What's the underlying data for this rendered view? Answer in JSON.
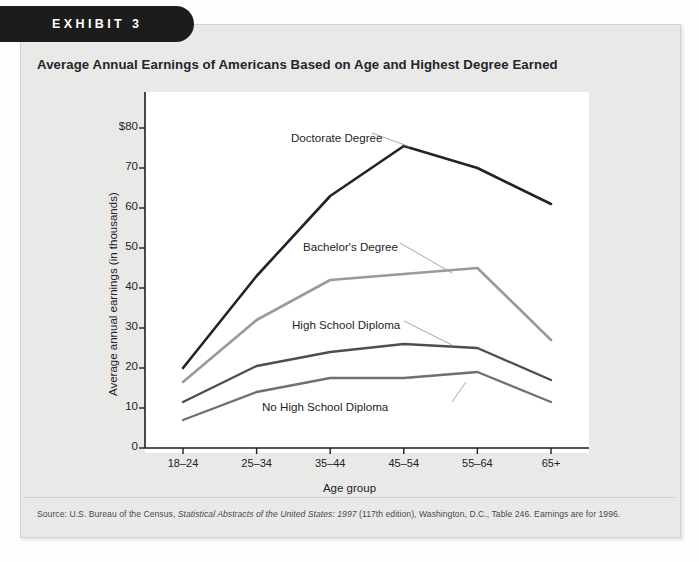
{
  "exhibit": {
    "label": "EXHIBIT 3"
  },
  "chart_data": {
    "type": "line",
    "title": "Average Annual Earnings of Americans Based on Age and Highest Degree Earned",
    "xlabel": "Age group",
    "ylabel": "Average annual earnings (in thousands)",
    "categories": [
      "18–24",
      "25–34",
      "35–44",
      "45–54",
      "55–64",
      "65+"
    ],
    "yticks": [
      "0",
      "10",
      "20",
      "30",
      "40",
      "50",
      "60",
      "70",
      "$80"
    ],
    "ytick_values": [
      0,
      10,
      20,
      30,
      40,
      50,
      60,
      70,
      80
    ],
    "ylim": [
      0,
      83
    ],
    "grid": false,
    "legend": "inline-annotations",
    "series": [
      {
        "name": "Doctorate Degree",
        "color": "#232326",
        "width": 2.6,
        "values": [
          20,
          43,
          63,
          75.5,
          70,
          61
        ]
      },
      {
        "name": "Bachelor's Degree",
        "color": "#9a9a9a",
        "width": 2.6,
        "values": [
          16.5,
          32,
          42,
          43.5,
          45,
          27
        ]
      },
      {
        "name": "High School Diploma",
        "color": "#4d4d52",
        "width": 2.3,
        "values": [
          11.5,
          20.5,
          24,
          26,
          25,
          17
        ]
      },
      {
        "name": "No High School Diploma",
        "color": "#6f6f74",
        "width": 2.3,
        "values": [
          7,
          14,
          17.5,
          17.5,
          19,
          11.5
        ]
      }
    ],
    "annotations": [
      {
        "text": "Doctorate Degree",
        "x": 291,
        "y": 131
      },
      {
        "text": "Bachelor's Degree",
        "x": 303,
        "y": 240
      },
      {
        "text": "High School Diploma",
        "x": 292,
        "y": 318
      },
      {
        "text": "No High School Diploma",
        "x": 262,
        "y": 400
      }
    ]
  },
  "source": {
    "prefix": "Source: U.S. Bureau of the Census, ",
    "italic_title": "Statistical Abstracts of the United States: 1997",
    "suffix": " (117th edition), Washington, D.C., Table 246. Earnings are for 1996."
  }
}
